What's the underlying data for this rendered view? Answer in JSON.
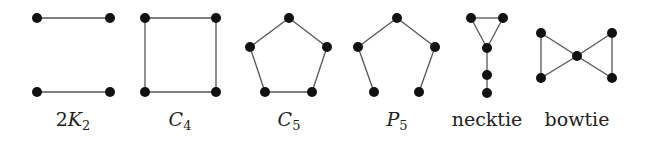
{
  "colors": {
    "vertex": "#111111",
    "edge": "#555555",
    "text": "#222222",
    "background": "#ffffff"
  },
  "graphs": [
    {
      "id": "2K2",
      "label": {
        "prefix": "2",
        "main": "K",
        "sub": "2",
        "style": "math"
      },
      "label_x": 73,
      "vertices": [
        [
          37,
          18
        ],
        [
          110,
          18
        ],
        [
          37,
          92
        ],
        [
          110,
          92
        ]
      ],
      "edges": [
        [
          0,
          1
        ],
        [
          2,
          3
        ]
      ]
    },
    {
      "id": "C4",
      "label": {
        "prefix": "",
        "main": "C",
        "sub": "4",
        "style": "math"
      },
      "label_x": 180,
      "vertices": [
        [
          145,
          18
        ],
        [
          216,
          18
        ],
        [
          216,
          92
        ],
        [
          145,
          92
        ]
      ],
      "edges": [
        [
          0,
          1
        ],
        [
          1,
          2
        ],
        [
          2,
          3
        ],
        [
          3,
          0
        ]
      ]
    },
    {
      "id": "C5",
      "label": {
        "prefix": "",
        "main": "C",
        "sub": "5",
        "style": "math"
      },
      "label_x": 289,
      "vertices": [
        [
          289,
          18
        ],
        [
          327,
          47
        ],
        [
          312,
          92
        ],
        [
          265,
          92
        ],
        [
          250,
          47
        ]
      ],
      "edges": [
        [
          0,
          1
        ],
        [
          1,
          2
        ],
        [
          2,
          3
        ],
        [
          3,
          4
        ],
        [
          4,
          0
        ]
      ]
    },
    {
      "id": "P5",
      "label": {
        "prefix": "",
        "main": "P",
        "sub": "5",
        "style": "math"
      },
      "label_x": 397,
      "vertices": [
        [
          374,
          92
        ],
        [
          358,
          47
        ],
        [
          397,
          18
        ],
        [
          435,
          47
        ],
        [
          419,
          92
        ]
      ],
      "edges": [
        [
          0,
          1
        ],
        [
          1,
          2
        ],
        [
          2,
          3
        ],
        [
          3,
          4
        ]
      ]
    },
    {
      "id": "necktie",
      "label": {
        "prefix": "",
        "main": "necktie",
        "sub": "",
        "style": "plain"
      },
      "label_x": 487,
      "vertices": [
        [
          471,
          18
        ],
        [
          503,
          18
        ],
        [
          487,
          48
        ],
        [
          487,
          75
        ],
        [
          487,
          93
        ]
      ],
      "edges": [
        [
          0,
          1
        ],
        [
          0,
          2
        ],
        [
          1,
          2
        ],
        [
          2,
          3
        ],
        [
          3,
          4
        ]
      ]
    },
    {
      "id": "bowtie",
      "label": {
        "prefix": "",
        "main": "bowtie",
        "sub": "",
        "style": "plain"
      },
      "label_x": 577,
      "vertices": [
        [
          541,
          33
        ],
        [
          541,
          78
        ],
        [
          577,
          56
        ],
        [
          612,
          33
        ],
        [
          612,
          78
        ]
      ],
      "edges": [
        [
          0,
          1
        ],
        [
          0,
          2
        ],
        [
          1,
          2
        ],
        [
          2,
          3
        ],
        [
          2,
          4
        ],
        [
          3,
          4
        ]
      ]
    }
  ]
}
